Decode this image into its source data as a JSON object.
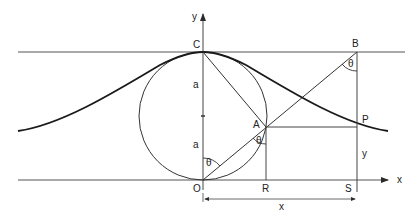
{
  "diagram": {
    "points": {
      "C": "C",
      "B": "B",
      "A": "A",
      "P": "P",
      "O": "O",
      "R": "R",
      "S": "S"
    },
    "axes": {
      "x": "x",
      "y": "y"
    },
    "labels": {
      "a_upper": "a",
      "a_lower": "a",
      "theta_B": "θ",
      "theta_A": "θ",
      "theta_O": "θ",
      "y_dim": "y",
      "x_dim": "x"
    },
    "colors": {
      "line": "#2a2a2a",
      "curve": "#1a1a1a",
      "background": "#ffffff"
    }
  }
}
